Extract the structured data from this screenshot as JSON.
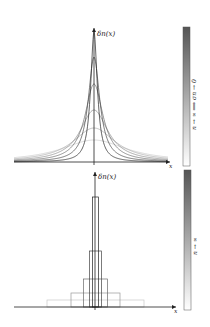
{
  "figure": {
    "top_panel": {
      "y_axis_label": "δn(x)",
      "x_axis_label": "x",
      "colorbar_label": "n → ∞  ⟹  σn → 0",
      "curve_type": "smooth peaked (Lorentzian-like) nascent delta functions",
      "curves": [
        {
          "width": 40,
          "height": 22,
          "shade": "#c8c8c8"
        },
        {
          "width": 26,
          "height": 34,
          "shade": "#a8a8a8"
        },
        {
          "width": 17,
          "height": 52,
          "shade": "#888888"
        },
        {
          "width": 11,
          "height": 78,
          "shade": "#666666"
        },
        {
          "width": 7,
          "height": 105,
          "shade": "#444444"
        },
        {
          "width": 4,
          "height": 130,
          "shade": "#222222"
        }
      ]
    },
    "bottom_panel": {
      "y_axis_label": "δn(x)",
      "x_axis_label": "x",
      "colorbar_label": "n → ∞",
      "curve_type": "rectangular pulses of unit area",
      "rectangles": [
        {
          "half_width": 48.5,
          "height": 7,
          "shade": "#c8c8c8"
        },
        {
          "half_width": 24.5,
          "height": 14,
          "shade": "#999999"
        },
        {
          "half_width": 12,
          "height": 28,
          "shade": "#6a6a6a"
        },
        {
          "half_width": 6,
          "height": 56,
          "shade": "#444444"
        },
        {
          "half_width": 3,
          "height": 110,
          "shade": "#222222"
        }
      ]
    },
    "colorbar": {
      "from": "#ffffff",
      "to": "#555555"
    }
  }
}
